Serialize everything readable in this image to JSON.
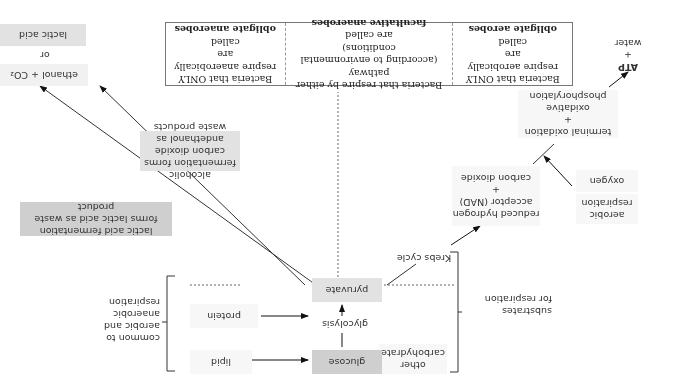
{
  "diagram": {
    "orientation": "rotated 180 degrees",
    "substrates": {
      "bracket_label": [
        "substrates",
        "for respiration"
      ],
      "other_carbohydrate": [
        "other",
        "carbohydrate"
      ],
      "glucose": "glucose",
      "lipid": "lipid",
      "protein": "protein"
    },
    "common": {
      "bracket_label": [
        "common to",
        "aerobic and",
        "anaerobic",
        "respiration"
      ]
    },
    "glycolysis": "glycolysis",
    "pyruvate": "pyruvate",
    "aerobic": {
      "section_label": [
        "aerobic",
        "respiration"
      ],
      "krebs_cycle": "Krebs cycle",
      "krebs_products": [
        "reduced hydrogen",
        "acceptor (NAD)",
        "+",
        "carbon dioxide"
      ],
      "oxygen": "oxygen",
      "oxidation": [
        "terminal oxidation",
        "+",
        "oxidative phosphorylation"
      ],
      "final_products": [
        "ATP",
        "+",
        "water"
      ]
    },
    "anaerobic": {
      "alcoholic_note": [
        "alcoholic fermentation forms",
        "carbon dioxide andethanol as",
        "waste products"
      ],
      "lactic_note": [
        "lactic acid fermentation",
        "forms lactic acid as waste product"
      ],
      "ethanol_co2": "ethanol + CO₂",
      "or": "or",
      "lactic_acid": "lactic acid"
    },
    "classification_table": [
      {
        "lines": [
          "Bacteria that ONLY",
          "respire aerobically are",
          "called"
        ],
        "term": "obligate aerobes"
      },
      {
        "lines": [
          "Bacteria that respire by either pathway",
          "(according to environmental conditions)",
          "are called"
        ],
        "term": "facultative anaerobes"
      },
      {
        "lines": [
          "Bacteria that ONLY",
          "respire anaerobically are",
          "called"
        ],
        "term": "obligate anaerobes"
      }
    ]
  }
}
